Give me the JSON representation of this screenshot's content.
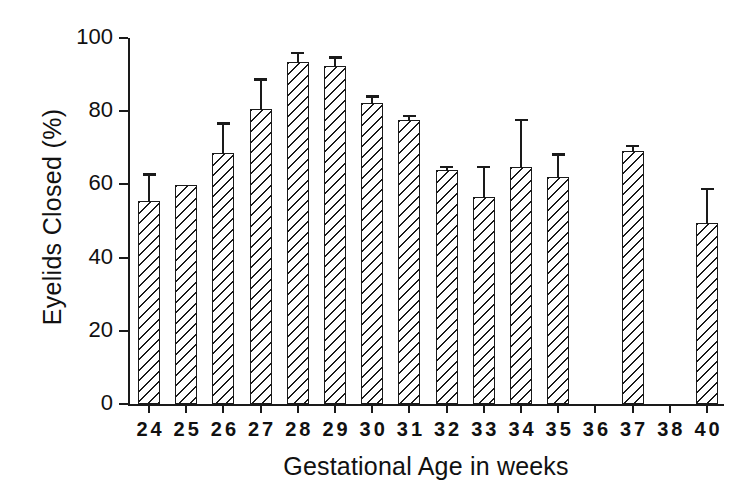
{
  "chart_data": {
    "type": "bar",
    "title": "",
    "xlabel": "Gestational Age in weeks",
    "ylabel": "Eyelids Closed (%)",
    "ylim": [
      0,
      100
    ],
    "yticks": [
      0,
      20,
      40,
      60,
      80,
      100
    ],
    "grid": false,
    "legend": "none",
    "error_bars": "upper only (SEM)",
    "categories": [
      "24",
      "25",
      "26",
      "27",
      "28",
      "29",
      "30",
      "31",
      "32",
      "33",
      "34",
      "35",
      "36",
      "37",
      "38",
      "40"
    ],
    "values": [
      55.5,
      59.8,
      68.5,
      80.5,
      93.4,
      92.3,
      82.3,
      77.5,
      64.0,
      56.5,
      64.8,
      62.0,
      null,
      69.2,
      null,
      49.5
    ],
    "errors": [
      7.5,
      0,
      8.5,
      8.5,
      2.8,
      2.5,
      2.0,
      1.5,
      1.0,
      8.5,
      13.0,
      6.5,
      null,
      1.5,
      9.5
    ],
    "error_upper": [
      63.0,
      59.8,
      77.0,
      89.0,
      96.2,
      95.0,
      84.3,
      79.0,
      65.0,
      65.0,
      78.0,
      68.5,
      null,
      70.8,
      null,
      59.0
    ]
  },
  "axis": {
    "y_tick_labels": [
      "0",
      "20",
      "40",
      "60",
      "80",
      "100"
    ],
    "x_tick_labels": [
      "24",
      "25",
      "26",
      "27",
      "28",
      "29",
      "30",
      "31",
      "32",
      "33",
      "34",
      "35",
      "36",
      "37",
      "38",
      "40"
    ]
  },
  "colors": {
    "ink": "#1a1a1a",
    "background": "#ffffff"
  }
}
